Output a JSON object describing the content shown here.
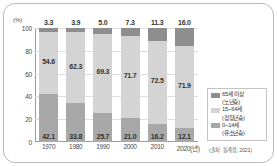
{
  "chart_data": {
    "type": "bar",
    "subtype": "stacked-100",
    "title": "",
    "xlabel": "",
    "ylabel": "(%)",
    "ylim": [
      0,
      100
    ],
    "yticks": [
      "100",
      "80",
      "60",
      "40",
      "20",
      "0"
    ],
    "grid": true,
    "legend_position": "right",
    "categories": [
      "1970",
      "1980",
      "1990",
      "2000",
      "2010",
      "2020(년)"
    ],
    "series": [
      {
        "name": "65세 이상\n(노년층)",
        "label": "65세 이상",
        "sublabel": "(노년층)",
        "color": "#8e8e8e",
        "values": [
          3.3,
          3.9,
          5.0,
          7.3,
          11.3,
          16.0
        ]
      },
      {
        "name": "15~64세\n(청장년층)",
        "label": "15~64세",
        "sublabel": "(청장년층)",
        "color": "#d4d4d4",
        "values": [
          54.6,
          62.3,
          69.3,
          71.7,
          72.5,
          71.9
        ]
      },
      {
        "name": "0~14세\n(유소년층)",
        "label": "0~14세",
        "sublabel": "(유소년층)",
        "color": "#a8a8a8",
        "values": [
          42.1,
          33.8,
          25.7,
          21.0,
          16.2,
          12.1
        ]
      }
    ],
    "source": "(출처: 통계청, 2021)"
  },
  "axis": {
    "unit": "(%)",
    "ticks": [
      "100",
      "80",
      "60",
      "40",
      "20",
      "0"
    ]
  },
  "top_values": [
    "3.3",
    "3.9",
    "5.0",
    "7.3",
    "11.3",
    "16.0"
  ],
  "mid_values": [
    "54.6",
    "62.3",
    "69.3",
    "71.7",
    "72.5",
    "71.9"
  ],
  "bottom_values": [
    "42.1",
    "33.8",
    "25.7",
    "21.0",
    "16.2",
    "12.1"
  ],
  "x_labels": [
    "1970",
    "1980",
    "1990",
    "2000",
    "2010",
    "2020(년)"
  ],
  "legend": {
    "items": [
      {
        "label": "65세 이상",
        "sublabel": "(노년층)",
        "color": "#8e8e8e"
      },
      {
        "label": "15~64세",
        "sublabel": "(청장년층)",
        "color": "#d4d4d4"
      },
      {
        "label": "0~14세",
        "sublabel": "(유소년층)",
        "color": "#a8a8a8"
      }
    ]
  },
  "source_note": "(출처: 통계청, 2021)"
}
